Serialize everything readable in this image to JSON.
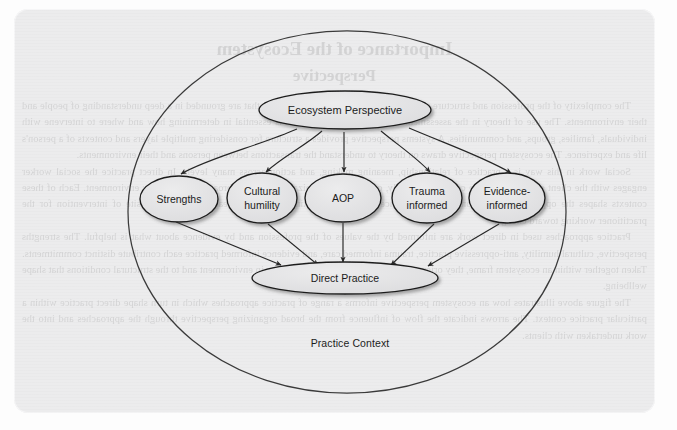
{
  "figure": {
    "context_label": "Practice Context",
    "nodes": {
      "top": {
        "label": "Ecosystem Perspective"
      },
      "middle": [
        {
          "label": "Strengths"
        },
        {
          "label": "Cultural\nhumility"
        },
        {
          "label": "AOP"
        },
        {
          "label": "Trauma\ninformed"
        },
        {
          "label": "Evidence-\ninformed"
        }
      ],
      "bottom": {
        "label": "Direct Practice"
      }
    },
    "colors": {
      "paper": "#ececed",
      "node_fill": "#e2e2e3",
      "node_stroke": "#1e1e1e",
      "arrow": "#2a2a2a",
      "text": "#1b1b1b"
    }
  },
  "bleed_text": {
    "heading_line1": "Importance of the Ecosystem",
    "heading_line2": "Perspective",
    "paragraphs": [
      "The complexity of the profession and structure require social work practice approaches that are grounded in a deep understanding of people and their environments. The use of theory in the assessment of the person and situation is essential in determining how and where to intervene with individuals, families, groups, and communities. A systems perspective provides a structure for considering multiple layers and contexts of a person's life and experience. The ecosystem perspective draws on theory to understand the transactions between persons and their environments.",
      "Social work in this way is a practice of relationship, meaning making, and action across many levels. In direct practice the social worker engages with the client system within the contexts of family, community, organizations, and the broader social policy environment. Each of these contexts shapes the opportunities and constraints experienced by people seeking service, and each is a potential site of intervention for the practitioner working toward change.",
      "Practice approaches used in direct work are informed by the values of the profession and by evidence about what is helpful. The strengths perspective, cultural humility, anti-oppressive practice, trauma informed care, and evidence informed practice each contribute distinct commitments. Taken together within an ecosystem frame, they orient the practitioner to the whole person in environment and to the structural conditions that shape wellbeing.",
      "The figure above illustrates how an ecosystem perspective informs a range of practice approaches which in turn shape direct practice within a particular practice context. The arrows indicate the flow of influence from the broad organizing perspective through the approaches and into the work undertaken with clients."
    ]
  }
}
